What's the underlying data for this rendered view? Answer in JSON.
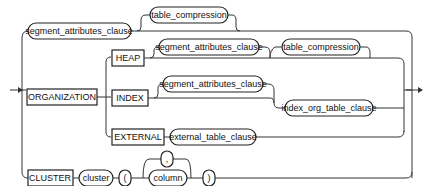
{
  "diagram": {
    "type": "railroad-syntax-diagram",
    "nodes": {
      "seg_attr_top": {
        "label": "segment_attributes_clause",
        "kind": "nonterminal"
      },
      "table_comp_top": {
        "label": "table_compression",
        "kind": "nonterminal"
      },
      "organization": {
        "label": "ORGANIZATION",
        "kind": "keyword"
      },
      "heap": {
        "label": "HEAP",
        "kind": "keyword"
      },
      "seg_attr_heap": {
        "label": "segment_attributes_clause",
        "kind": "nonterminal"
      },
      "table_comp_heap": {
        "label": "table_compression",
        "kind": "nonterminal"
      },
      "index": {
        "label": "INDEX",
        "kind": "keyword"
      },
      "seg_attr_index": {
        "label": "segment_attributes_clause",
        "kind": "nonterminal"
      },
      "index_org": {
        "label": "index_org_table_clause",
        "kind": "nonterminal"
      },
      "external": {
        "label": "EXTERNAL",
        "kind": "keyword"
      },
      "external_clause": {
        "label": "external_table_clause",
        "kind": "nonterminal"
      },
      "cluster_kw": {
        "label": "CLUSTER",
        "kind": "keyword"
      },
      "cluster": {
        "label": "cluster",
        "kind": "nonterminal"
      },
      "lparen": {
        "label": "(",
        "kind": "symbol"
      },
      "comma": {
        "label": ",",
        "kind": "symbol"
      },
      "column": {
        "label": "column",
        "kind": "nonterminal"
      },
      "rparen": {
        "label": ")",
        "kind": "symbol"
      }
    }
  }
}
